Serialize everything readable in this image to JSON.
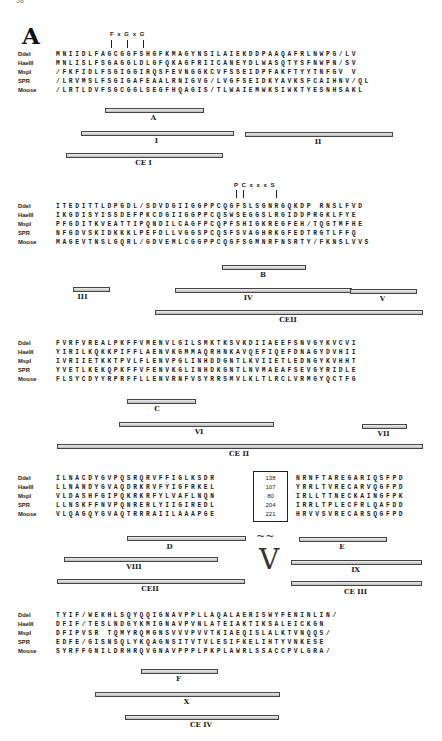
{
  "page_number": "58",
  "panel_letter": "A",
  "species": [
    "DdeI",
    "HaeIII",
    "MspI",
    "SPR",
    "Mouse"
  ],
  "blocks": [
    {
      "motif": "F x G x G",
      "rows": [
        {
          "label": "DdeI",
          "seq": " MNIIDLFAGCGGFSHGFKMAGYNSILAIEKDDPAAQAFRLNWPG/LV"
        },
        {
          "label": "HaeIII",
          "seq": " MNLISLFSGAGGLDLGFQKAGFRIICANEYDLWASQTYSFNWPN/SV"
        },
        {
          "label": "MspI",
          "seq": "/FKFIDLFSGIGGIRQSFEVNGGKCVFSSEIDPFAKFTYYTNFGV  V"
        },
        {
          "label": "SPR",
          "seq": "/LRVMSLFSGIGAFEAALRNIGVG/LVGFSEIDKYAVKSFCAIHNV/QL"
        },
        {
          "label": "Mouse",
          "seq": "/LRTLDVFSGCGGLSEGFHQAGIS/TLWAIEMWKSIWKTYESNHSAKL"
        }
      ],
      "bars": [
        {
          "label": "A",
          "x": 105,
          "w": 97,
          "y": 108
        },
        {
          "label": "I",
          "x": 81,
          "w": 151,
          "y": 131
        },
        {
          "label": "II",
          "x": 245,
          "w": 146,
          "y": 132
        },
        {
          "label": "CE I",
          "x": 66,
          "w": 155,
          "y": 153
        }
      ]
    },
    {
      "motif": "P C x x x S",
      "rows": [
        {
          "label": "DdeI",
          "seq": "ITEDITTLDPGDL/SDVDGIIGGPPCQGFSLSGNRGQKDP RNSLFVD"
        },
        {
          "label": "HaeIII",
          "seq": "IKGDISYISSDEFPKCDGIIGGPPCQSWSEGGSLRGIDDPRGKLFYE"
        },
        {
          "label": "MspI",
          "seq": "PFGDITKVEATTIPQNDILCAGFPCQPFSHIGKREGFEH/TQGTMFHE"
        },
        {
          "label": "SPR",
          "seq": "NFGDVSKIDKKKLPEFDLLVGGSPCQSFSVAGHRKGFEDTRGTLFFQ"
        },
        {
          "label": "Mouse",
          "seq": "MAGEVTNSLGQRL/GDVEMLCGGPPCQGFSGMNRFNSRTY/FKNSLVVS"
        }
      ],
      "bars": [
        {
          "label": "B",
          "x": 222,
          "w": 82,
          "y": 265
        },
        {
          "label": "III",
          "x": 73,
          "w": 35,
          "y": 287
        },
        {
          "label": "IV",
          "x": 175,
          "w": 175,
          "y": 288
        },
        {
          "label": "V",
          "x": 350,
          "w": 65,
          "y": 289
        },
        {
          "label": "CEII",
          "x": 155,
          "w": 266,
          "y": 310
        }
      ]
    },
    {
      "motif": "",
      "rows": [
        {
          "label": "DdeI",
          "seq": "FVRFVREALPKFFVMENVLGILSMKTKSVKDIIAEEFSNVGYKVCVI"
        },
        {
          "label": "HaeIII",
          "seq": "YIRILKQKKPIFFLAENVKGMMAQRHNKAVQEFIQEFDNAGYDVHII"
        },
        {
          "label": "MspI",
          "seq": "IVRIIETKKTPVLFLENVPGLINHDDGNTLKVIIETLEDNGYKVHHT"
        },
        {
          "label": "SPR",
          "seq": "YVETLKEKQPKFFVFENVKGLINHDKGNTLNVMAEAFSEVGYRIDLE"
        },
        {
          "label": "Mouse",
          "seq": "FLSYCDYYRPRFFLLENVRNFVSYRRSMVLKLTLRCLVRMGYQCTFG"
        }
      ],
      "bars": [
        {
          "label": "C",
          "x": 127,
          "w": 67,
          "y": 399
        },
        {
          "label": "VI",
          "x": 119,
          "w": 153,
          "y": 422
        },
        {
          "label": "VII",
          "x": 362,
          "w": 43,
          "y": 424
        },
        {
          "label": "CE II",
          "x": 57,
          "w": 364,
          "y": 444
        }
      ]
    },
    {
      "motif": "",
      "rows": [
        {
          "label": "DdeI",
          "seq": "ILNACDYGVPQSRQRVFFIGLKSDR",
          "gap": "138",
          "seq2": "NRNFTAREGARIQSFPD"
        },
        {
          "label": "HaeIII",
          "seq": "LLNANDYGVAQDRKRVFYIGFRKEL",
          "gap": "107",
          "seq2": "YRRLTVRECARVQGFPD"
        },
        {
          "label": "MspI",
          "seq": "VLDASHFGIPQKRKRFYLVAFLNQN",
          "gap": "80",
          "seq2": "IRLLTTNECKAINGFPK"
        },
        {
          "label": "SPR",
          "seq": "LLNSKFFNVPQNRERLYIIGIREDL",
          "gap": "204",
          "seq2": "IRRLTPLECFRLQAFDD"
        },
        {
          "label": "Mouse",
          "seq": "VLQAGQYGVAQTRRRAIILAAAPGE",
          "gap": "221",
          "seq2": "HRVVSVRECARSQGFPD"
        }
      ],
      "bars": [
        {
          "label": "D",
          "x": 127,
          "w": 117,
          "y": 536
        },
        {
          "label": "E",
          "x": 299,
          "w": 86,
          "y": 537
        },
        {
          "label": "VIII",
          "x": 64,
          "w": 152,
          "y": 557
        },
        {
          "label": "IX",
          "x": 291,
          "w": 129,
          "y": 560
        },
        {
          "label": "CEII",
          "x": 57,
          "w": 186,
          "y": 579
        },
        {
          "label": "CE III",
          "x": 291,
          "w": 129,
          "y": 581
        }
      ],
      "variable_region_symbol": "V",
      "gap_symbol": "~~"
    },
    {
      "motif": "",
      "rows": [
        {
          "label": "DdeI",
          "seq": "TYIF/WEKHLSQYQQIGNAVPPLLAQALAERISWYFENINLIN/"
        },
        {
          "label": "HaeIII",
          "seq": "DFIF/TESLNDGYKMIGNAVPVNLATEIAKTIKSALEICKGN"
        },
        {
          "label": "MspI",
          "seq": "DFIPVSR TQMYRQMGNSVVVPVVTKIAEQISLALKTVNQQS/"
        },
        {
          "label": "SPR",
          "seq": "EDFE/GISNSQLYKQAGNSITVTVLESIFKELIHTYVNKESE"
        },
        {
          "label": "Mouse",
          "seq": "SYRFFGNILDRHRQVGNAVPPPLPKPLAWRLSSACCPVLGRA/"
        }
      ],
      "bars": [
        {
          "label": "F",
          "x": 141,
          "w": 75,
          "y": 669
        },
        {
          "label": "X",
          "x": 95,
          "w": 183,
          "y": 692
        },
        {
          "label": "CE IV",
          "x": 125,
          "w": 152,
          "y": 715
        }
      ]
    }
  ]
}
